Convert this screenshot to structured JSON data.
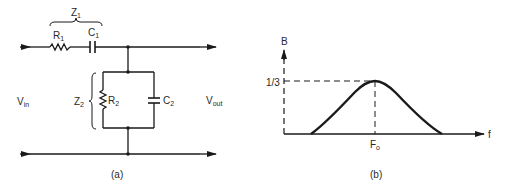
{
  "circuit": {
    "caption": "(a)",
    "z1_label": "Z",
    "z1_sub": "1",
    "z2_label": "Z",
    "z2_sub": "2",
    "r1_label": "R",
    "r1_sub": "1",
    "c1_label": "C",
    "c1_sub": "1",
    "r2_label": "R",
    "r2_sub": "2",
    "c2_label": "C",
    "c2_sub": "2",
    "vin_label": "V",
    "vin_sub": "in",
    "vout_label": "V",
    "vout_sub": "out"
  },
  "graph": {
    "caption": "(b)",
    "y_axis_label": "B",
    "x_axis_label": "f",
    "peak_value_label": "1/3",
    "peak_freq_label": "F",
    "peak_freq_sub": "o"
  },
  "colors": {
    "line": "#1a1a1a",
    "text": "#2a2a2a",
    "background": "#ffffff"
  }
}
